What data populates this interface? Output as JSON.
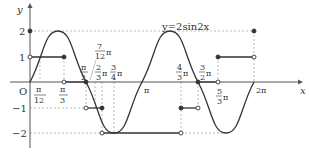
{
  "figure": {
    "axis_labels": {
      "x": "x",
      "y": "y",
      "origin": "O"
    },
    "curve_label": "y=2sin2x",
    "y_ticks": [
      {
        "value": 2,
        "label": "2"
      },
      {
        "value": 1,
        "label": "1"
      },
      {
        "value": -1,
        "label": "−1"
      },
      {
        "value": -2,
        "label": "−2"
      }
    ],
    "x_ticks": [
      {
        "label_num": "π",
        "label_den": "12"
      },
      {
        "label_num": "π",
        "label_den": "3"
      },
      {
        "label_num": "π",
        "label_den": "2"
      },
      {
        "label_num": "7",
        "label_den": "12",
        "suffix": "π"
      },
      {
        "label_num": "2",
        "label_den": "3",
        "suffix": "π"
      },
      {
        "label_num": "3",
        "label_den": "4",
        "suffix": "π"
      },
      {
        "label": "π"
      },
      {
        "label_num": "4",
        "label_den": "3",
        "suffix": "π"
      },
      {
        "label_num": "3",
        "label_den": "2",
        "suffix": "π"
      },
      {
        "label_num": "5",
        "label_den": "3",
        "suffix": "π"
      },
      {
        "label": "2π"
      }
    ],
    "colors": {
      "curve": "#333333",
      "axis": "#555555",
      "dashed": "#999999"
    }
  }
}
